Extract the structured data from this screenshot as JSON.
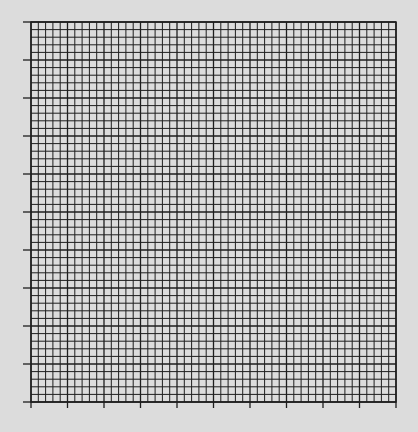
{
  "graph_paper": {
    "major_divisions_x": 10,
    "major_divisions_y": 10,
    "minor_per_major": 5,
    "line_color": "#1e1e1e",
    "background_color": "#dcdcdc",
    "tick_marks": {
      "x_axis": "bottom",
      "y_axis": "left"
    }
  }
}
